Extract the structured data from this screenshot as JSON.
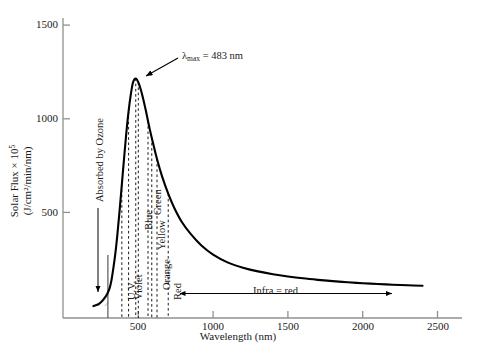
{
  "chart_data": {
    "type": "line",
    "title": "",
    "xlabel": "Wavelength (nm)",
    "ylabel_line1": "Solar Flux × 10",
    "ylabel_exp": "5",
    "ylabel_line2": "(J/cm²/min/nm)",
    "xlim": [
      0,
      2600
    ],
    "ylim": [
      0,
      1600
    ],
    "xticks": [
      500,
      1000,
      1500,
      2000,
      2500
    ],
    "xtick_labels": [
      "500",
      "1000",
      "1500",
      "2000",
      "2500"
    ],
    "yticks": [
      500,
      1000,
      1500
    ],
    "ytick_labels": [
      "500",
      "1000",
      "1500"
    ],
    "grid": false,
    "legend": "none",
    "series": [
      {
        "name": "Solar Flux",
        "x": [
          200,
          230,
          250,
          270,
          290,
          300,
          310,
          320,
          330,
          345,
          360,
          375,
          390,
          405,
          420,
          435,
          450,
          465,
          483,
          500,
          515,
          530,
          550,
          575,
          600,
          630,
          660,
          700,
          740,
          790,
          850,
          920,
          1000,
          1100,
          1200,
          1300,
          1400,
          1500,
          1600,
          1700,
          1800,
          1900,
          2000,
          2100,
          2200,
          2300,
          2400
        ],
        "y": [
          0,
          8,
          20,
          38,
          62,
          78,
          100,
          135,
          185,
          270,
          380,
          510,
          650,
          790,
          925,
          1040,
          1130,
          1195,
          1215,
          1195,
          1160,
          1115,
          1045,
          950,
          865,
          770,
          690,
          600,
          525,
          450,
          385,
          325,
          275,
          232,
          205,
          185,
          170,
          158,
          148,
          140,
          133,
          127,
          122,
          118,
          114,
          111,
          108
        ]
      }
    ],
    "annotations": [
      {
        "name": "lambda-max",
        "text_prefix": "λ",
        "text_sub": "max",
        "text_suffix": " = 483 nm",
        "x": 483,
        "y": 1215
      },
      {
        "name": "absorbed-by-ozone",
        "text": "Absorbed by Ozone"
      },
      {
        "name": "infra-red",
        "text": "Infra = red",
        "x_start": 720,
        "x_end": 2150
      }
    ],
    "shaded_region": {
      "name": "ozone-absorption",
      "label": "Absorbed by Ozone",
      "x_start": 200,
      "x_end": 300,
      "hatch": true
    },
    "spectrum_bands": [
      {
        "label": "U.V.",
        "x": 390
      },
      {
        "label": "Violet",
        "x": 435
      },
      {
        "label": "Blue",
        "x": 500
      },
      {
        "label": "Green",
        "x": 565
      },
      {
        "label": "Yellow",
        "x": 590
      },
      {
        "label": "Orange",
        "x": 625
      },
      {
        "label": "Red",
        "x": 700
      }
    ],
    "dashed_lines_x": [
      390,
      435,
      483,
      500,
      565,
      590,
      625,
      700
    ],
    "colors": {
      "curve": "#000000",
      "axis": "#808080",
      "dashed": "#000000",
      "text": "#1a1a1a",
      "hatch": "#666666",
      "background": "#ffffff"
    }
  }
}
